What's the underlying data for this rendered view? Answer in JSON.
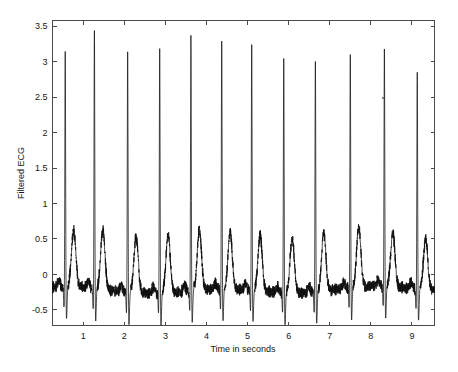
{
  "chart_data": {
    "type": "line",
    "title": "",
    "xlabel": "Time in seconds",
    "ylabel": "Filtered ECG",
    "xlim": [
      0.25,
      9.55
    ],
    "ylim": [
      -0.72,
      3.58
    ],
    "xticks": [
      1,
      2,
      3,
      4,
      5,
      6,
      7,
      8,
      9
    ],
    "xtick_labels": [
      "1",
      "2",
      "3",
      "4",
      "5",
      "6",
      "7",
      "8",
      "9"
    ],
    "yticks": [
      -0.5,
      0,
      0.5,
      1,
      1.5,
      2,
      2.5,
      3,
      3.5
    ],
    "ytick_labels": [
      "-0.5",
      "0",
      "0.5",
      "1",
      "1.5",
      "2",
      "2.5",
      "3",
      "3.5"
    ],
    "grid": false,
    "legend": null,
    "series": [
      {
        "name": "Filtered ECG",
        "color": "#101010",
        "description": "Band-pass filtered single-lead ECG, 11 QRS complexes over ~9.3 s, noisy baseline, prominent T-waves near 0.5 mV",
        "r_peak_times": [
          0.56,
          1.27,
          2.08,
          2.86,
          3.62,
          4.37,
          5.1,
          5.88,
          6.65,
          7.5,
          8.33,
          9.13
        ],
        "r_peak_values": [
          3.15,
          3.45,
          3.2,
          3.27,
          3.42,
          3.32,
          3.28,
          3.12,
          3.08,
          3.12,
          3.18,
          2.87
        ],
        "t_wave_values": [
          0.58,
          0.62,
          0.57,
          0.6,
          0.63,
          0.58,
          0.57,
          0.55,
          0.6,
          0.62,
          0.55,
          0.5
        ],
        "baseline_mean": -0.22,
        "baseline_noise_amplitude": 0.09,
        "s_wave_depth": -0.72,
        "sampling_note": "trace drawn from per-beat PQRST template"
      }
    ]
  },
  "figure": {
    "background_color": "#ffffff",
    "axis_color": "#4a4a4a",
    "text_color": "#161616",
    "trace_color": "#101010"
  },
  "artifacts": {
    "speck_label": "scan-speck"
  }
}
